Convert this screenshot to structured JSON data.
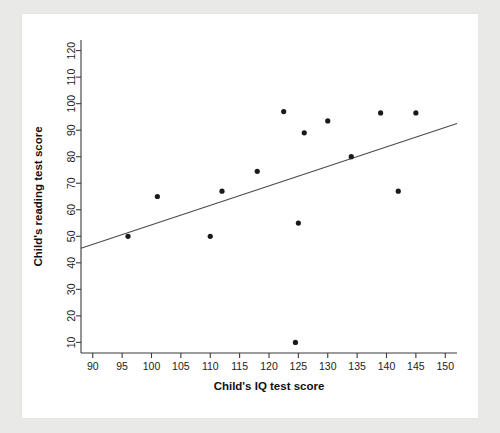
{
  "chart_data": {
    "type": "scatter",
    "title": "",
    "xlabel": "Child's IQ test score",
    "ylabel": "Child's reading test score",
    "xlim": [
      88,
      152
    ],
    "ylim": [
      6,
      124
    ],
    "xticks": [
      90,
      95,
      100,
      105,
      110,
      115,
      120,
      125,
      130,
      135,
      140,
      145,
      150
    ],
    "yticks": [
      10,
      20,
      30,
      40,
      50,
      60,
      70,
      80,
      90,
      100,
      110,
      120
    ],
    "xtick_labels": [
      "90",
      "95",
      "100",
      "105",
      "110",
      "115",
      "120",
      "125",
      "130",
      "135",
      "140",
      "145",
      "150"
    ],
    "ytick_labels": [
      "10",
      "20",
      "30",
      "40",
      "50",
      "60",
      "70",
      "80",
      "90",
      "100",
      "110",
      "120"
    ],
    "grid": false,
    "legend": "none",
    "marker_color": "#1a1a1a",
    "line_color": "#4a4a4a",
    "points": [
      {
        "x": 96.0,
        "y": 50.0
      },
      {
        "x": 101.0,
        "y": 65.0
      },
      {
        "x": 110.0,
        "y": 50.0
      },
      {
        "x": 112.0,
        "y": 67.0
      },
      {
        "x": 118.0,
        "y": 74.5
      },
      {
        "x": 122.5,
        "y": 97.0
      },
      {
        "x": 124.5,
        "y": 10.0
      },
      {
        "x": 125.0,
        "y": 55.0
      },
      {
        "x": 126.0,
        "y": 89.0
      },
      {
        "x": 130.0,
        "y": 93.5
      },
      {
        "x": 134.0,
        "y": 80.0
      },
      {
        "x": 139.0,
        "y": 96.5
      },
      {
        "x": 142.0,
        "y": 67.0
      },
      {
        "x": 145.0,
        "y": 96.5
      }
    ],
    "fit_line": {
      "name": "linear regression",
      "x_start": 88.0,
      "y_start": 45.5,
      "x_end": 152.0,
      "y_end": 92.5
    }
  }
}
